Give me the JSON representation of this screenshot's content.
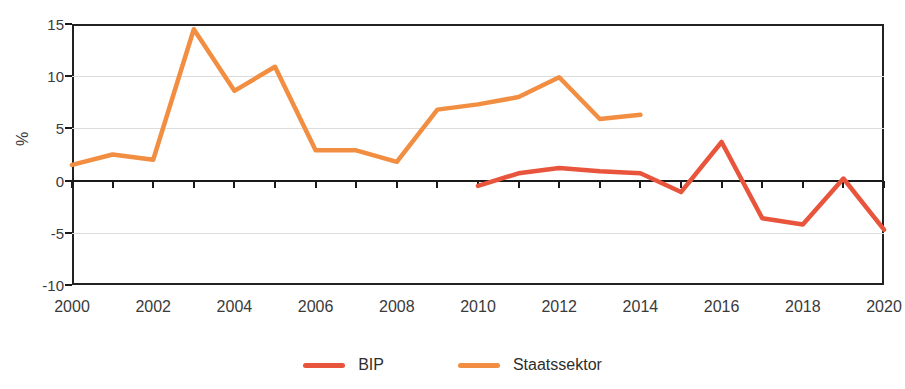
{
  "chart_data": {
    "type": "line",
    "title": "",
    "xlabel": "",
    "ylabel": "%",
    "xlim": [
      2000,
      2020
    ],
    "ylim": [
      -10,
      15
    ],
    "yticks": [
      15,
      10,
      5,
      0,
      -5,
      -10
    ],
    "ytick_labels": [
      "15",
      "10",
      "5",
      "0",
      "-5",
      "-10"
    ],
    "xticks": [
      2000,
      2001,
      2002,
      2003,
      2004,
      2005,
      2006,
      2007,
      2008,
      2009,
      2010,
      2011,
      2012,
      2013,
      2014,
      2015,
      2016,
      2017,
      2018,
      2019,
      2020
    ],
    "xtick_labels_shown": [
      "2000",
      "2002",
      "2004",
      "2006",
      "2008",
      "2010",
      "2012",
      "2014",
      "2016",
      "2018",
      "2020"
    ],
    "grid": true,
    "grid_axis": "y",
    "legend_position": "bottom",
    "zero_line": true,
    "series": [
      {
        "name": "BIP",
        "color": "#E8553C",
        "x": [
          2010,
          2011,
          2012,
          2013,
          2014,
          2015,
          2016,
          2017,
          2018,
          2019,
          2020
        ],
        "values": [
          -0.5,
          0.7,
          1.2,
          0.9,
          0.7,
          -1.1,
          3.7,
          -3.6,
          -4.2,
          0.2,
          -4.7
        ]
      },
      {
        "name": "Staatssektor",
        "color": "#F28E42",
        "x": [
          2000,
          2001,
          2002,
          2003,
          2004,
          2005,
          2006,
          2007,
          2008,
          2009,
          2010,
          2011,
          2012,
          2013,
          2014
        ],
        "values": [
          1.5,
          2.5,
          2.0,
          14.5,
          8.6,
          10.9,
          2.9,
          2.9,
          1.8,
          6.8,
          7.3,
          8.0,
          9.9,
          5.9,
          6.3
        ]
      }
    ]
  },
  "legend": {
    "items": [
      {
        "label": "BIP",
        "color": "#E8553C"
      },
      {
        "label": "Staatssektor",
        "color": "#F28E42"
      }
    ]
  },
  "axis": {
    "unit_label": "%"
  }
}
